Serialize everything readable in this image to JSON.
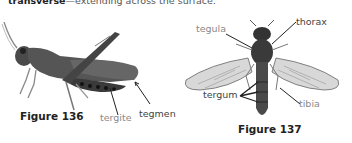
{
  "intro": {
    "term": "transverse",
    "definition": "—extending across the surface."
  },
  "figure136": {
    "caption": "Figure 136",
    "subject": "grasshopper",
    "labels": {
      "tergite": "tergite",
      "tegmen": "tegmen"
    }
  },
  "figure137": {
    "caption": "Figure 137",
    "subject": "fly",
    "labels": {
      "tegula": "tegula",
      "thorax": "thorax",
      "tergum": "tergum",
      "tibia": "tibia"
    }
  }
}
